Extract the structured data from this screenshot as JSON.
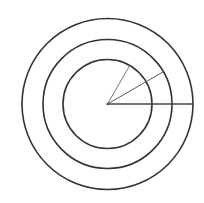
{
  "diagram": {
    "type": "concentric-circles-with-radii",
    "background": "#ffffff",
    "center": {
      "x": 107.5,
      "y": 104
    },
    "stroke_color": "#333333",
    "circles": [
      {
        "name": "inner-circle",
        "r": 44.5,
        "stroke_width": 1.6
      },
      {
        "name": "middle-circle",
        "r": 64.5,
        "stroke_width": 1.6
      },
      {
        "name": "outer-circle",
        "r": 85.5,
        "stroke_width": 1.6
      }
    ],
    "radii": [
      {
        "name": "radius-to-outer-0deg",
        "angle_deg": 0,
        "length": 85.5,
        "stroke_color": "#444444",
        "stroke_width": 1.3
      },
      {
        "name": "radius-to-middle-30deg",
        "angle_deg": 30,
        "length": 64.5,
        "stroke_color": "#555555",
        "stroke_width": 1.0
      },
      {
        "name": "radius-to-inner-60deg",
        "angle_deg": 60,
        "length": 44.5,
        "stroke_color": "#666666",
        "stroke_width": 0.9
      }
    ]
  }
}
